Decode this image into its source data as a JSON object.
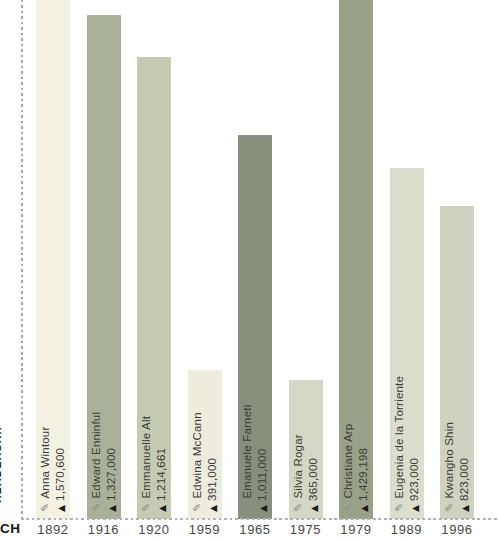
{
  "chart_data": {
    "type": "bar",
    "title": "",
    "ylabel": "READERSHIP",
    "xlabel_partial": "CH",
    "categories": [
      "1892",
      "1916",
      "1920",
      "1959",
      "1965",
      "1975",
      "1979",
      "1989",
      "1996"
    ],
    "bars": [
      {
        "year": "1892",
        "editor": "Anna Wintour",
        "readership_label": "1,570,600",
        "readership": 1570600,
        "color": "#f3f1e2"
      },
      {
        "year": "1916",
        "editor": "Edward Enninful",
        "readership_label": "1,327,000",
        "readership": 1327000,
        "color": "#a9b199"
      },
      {
        "year": "1920",
        "editor": "Emmanuelle Alt",
        "readership_label": "1,214,661",
        "readership": 1214661,
        "color": "#c5cbb2"
      },
      {
        "year": "1959",
        "editor": "Edwina McCann",
        "readership_label": "391,000",
        "readership": 391000,
        "color": "#edecdd"
      },
      {
        "year": "1965",
        "editor": "Emanuele Farneti",
        "readership_label": "1,011,000",
        "readership": 1011000,
        "color": "#87907c"
      },
      {
        "year": "1975",
        "editor": "Silvia Rogar",
        "readership_label": "365,000",
        "readership": 365000,
        "color": "#d5d7c6"
      },
      {
        "year": "1979",
        "editor": "Christiane Arp",
        "readership_label": "1,429,198",
        "readership": 1429198,
        "color": "#99a189"
      },
      {
        "year": "1989",
        "editor": "Eugenia de la Torriente",
        "readership_label": "923,000",
        "readership": 923000,
        "color": "#dcdecd"
      },
      {
        "year": "1996",
        "editor": "Kwangho Shin",
        "readership_label": "823,000",
        "readership": 823000,
        "color": "#cfd2c0"
      }
    ],
    "icons": {
      "editor_icon": "pencil-icon",
      "editor_icon_glyph": "✎",
      "readership_icon": "triangle-icon",
      "readership_icon_glyph": "▲"
    },
    "layout": {
      "baseline_y": 519,
      "bar_width": 34,
      "first_bar_left": 36,
      "bar_step": 50.5,
      "px_per_reader": 0.00038,
      "bars_clipped_at_top": [
        "1892",
        "1979"
      ],
      "axis_style": "dashed",
      "grid": false,
      "legend": false
    }
  }
}
